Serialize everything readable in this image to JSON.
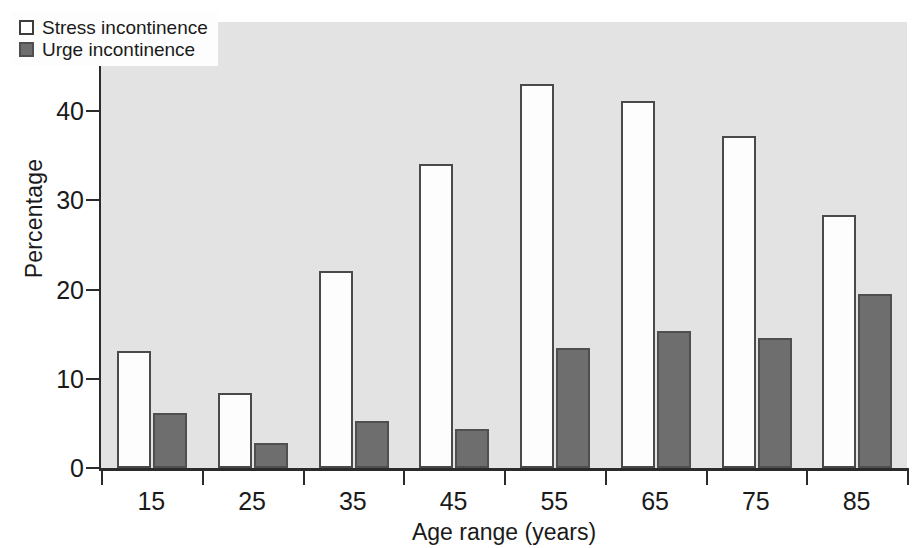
{
  "chart_data": {
    "type": "bar",
    "title": "",
    "xlabel": "Age range (years)",
    "ylabel": "Percentage",
    "categories": [
      "15",
      "25",
      "35",
      "45",
      "55",
      "65",
      "75",
      "85"
    ],
    "series": [
      {
        "name": "Stress incontinence",
        "color": "#ffffff",
        "values": [
          13.1,
          8.4,
          22.1,
          34.1,
          43.1,
          41.2,
          37.2,
          28.4
        ]
      },
      {
        "name": "Urge incontinence",
        "color": "#6e6e6e",
        "values": [
          6.2,
          2.8,
          5.3,
          4.4,
          13.4,
          15.4,
          14.6,
          19.5
        ]
      }
    ],
    "ylim": [
      0,
      50
    ],
    "y_ticks": [
      0,
      10,
      20,
      30,
      40,
      50
    ],
    "y_ticklabels": [
      "0",
      "10",
      "20",
      "30",
      "40",
      "50"
    ],
    "grid": false,
    "legend_position": "upper-left"
  },
  "legend": {
    "entries": [
      {
        "label": "Stress incontinence",
        "swatch": "open-square-swatch"
      },
      {
        "label": "Urge incontinence",
        "swatch": "filled-square-swatch"
      }
    ]
  },
  "axes": {
    "y_title": "Percentage",
    "x_title": "Age range (years)"
  }
}
